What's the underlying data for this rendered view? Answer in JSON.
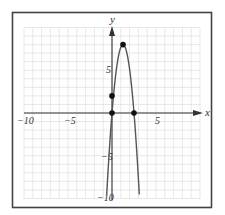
{
  "chart_data": {
    "type": "line",
    "title": "",
    "xlabel": "x",
    "ylabel": "y",
    "xlim": [
      -10,
      10
    ],
    "ylim": [
      -10,
      10
    ],
    "grid": true,
    "x_ticks": [
      {
        "value": -10,
        "label": "−10"
      },
      {
        "value": -5,
        "label": "−5"
      },
      {
        "value": 5,
        "label": "5"
      }
    ],
    "y_ticks": [
      {
        "value": 5,
        "label": "5"
      },
      {
        "value": -5,
        "label": "−5"
      },
      {
        "value": -10,
        "label": "−10"
      }
    ],
    "series": [
      {
        "name": "parabola",
        "equation": "y = -5.12x^2 + 12.8x",
        "x": [
          -0.6,
          0,
          0.5,
          1.0,
          1.25,
          1.5,
          2.0,
          2.5,
          3.0,
          3.1
        ],
        "y": [
          -9.5,
          0,
          5.12,
          7.68,
          8.0,
          7.68,
          5.12,
          0,
          -7.68,
          -9.52
        ],
        "color": "#555555"
      }
    ],
    "marked_points": [
      {
        "label": "vertex",
        "x": 1.25,
        "y": 8
      },
      {
        "label": "y-axis point",
        "x": 0,
        "y": 2
      },
      {
        "label": "origin root",
        "x": 0,
        "y": 0
      },
      {
        "label": "x-intercept",
        "x": 2.5,
        "y": 0
      }
    ]
  },
  "labels": {
    "x_axis": "x",
    "y_axis": "y",
    "tick_x_neg10": "−10",
    "tick_x_neg5": "−5",
    "tick_x_5": "5",
    "tick_y_5": "5",
    "tick_y_neg5": "−5",
    "tick_y_neg10": "−10"
  },
  "colors": {
    "frame": "#444444",
    "grid": "#e2e2e2",
    "axis": "#333333",
    "curve": "#555555",
    "point": "#111111"
  }
}
